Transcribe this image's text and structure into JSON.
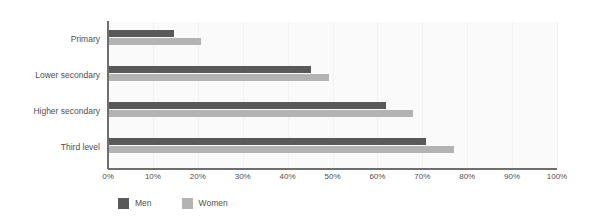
{
  "chart_data": {
    "type": "bar",
    "orientation": "horizontal",
    "title": "",
    "subtitle": "",
    "xlabel": "",
    "ylabel": "",
    "xlim": [
      0,
      100
    ],
    "xtick_labels": [
      "0%",
      "10%",
      "20%",
      "30%",
      "40%",
      "50%",
      "60%",
      "70%",
      "80%",
      "90%",
      "100%"
    ],
    "xticks": [
      0,
      10,
      20,
      30,
      40,
      50,
      60,
      70,
      80,
      90,
      100
    ],
    "grid": true,
    "grid_axis": "x",
    "legend_position": "bottom-left",
    "categories": [
      "Primary",
      "Lower secondary",
      "Higher secondary",
      "Third level"
    ],
    "series": [
      {
        "name": "Men",
        "color": "#595959",
        "values": [
          14.5,
          45.0,
          61.7,
          70.6
        ]
      },
      {
        "name": "Women",
        "color": "#b3b3b3",
        "values": [
          20.5,
          49.0,
          67.7,
          76.8
        ]
      }
    ]
  },
  "colors": {
    "men": "#595959",
    "women": "#b3b3b3",
    "axis": "#6e6e6e",
    "gridline": "#f2f2f2",
    "plot_background": "#fafafa",
    "page_background": "#ffffff",
    "text": "#4f4f4f"
  }
}
